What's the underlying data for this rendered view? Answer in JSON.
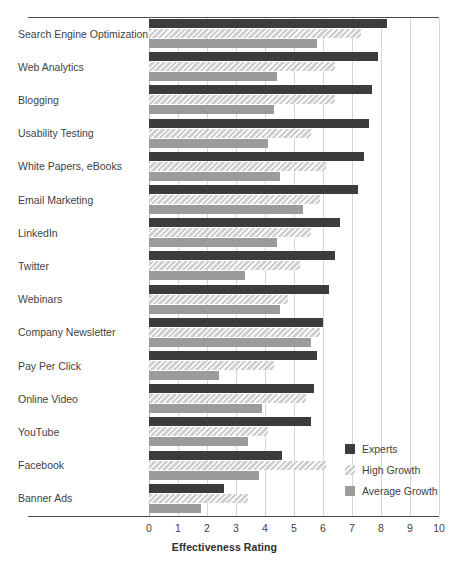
{
  "chart_data": {
    "type": "bar",
    "orientation": "horizontal",
    "title": "",
    "xlabel": "Effectiveness Rating",
    "ylabel": "",
    "xlim": [
      0,
      10
    ],
    "xticks": [
      "0",
      "1",
      "2",
      "3",
      "4",
      "5",
      "6",
      "7",
      "8",
      "9",
      "10"
    ],
    "grid": "vertical",
    "legend_position": "inside-right",
    "categories": [
      "Search Engine Optimization",
      "Web Analytics",
      "Blogging",
      "Usability Testing",
      "White Papers, eBooks",
      "Email Marketing",
      "LinkedIn",
      "Twitter",
      "Webinars",
      "Company Newsletter",
      "Pay Per Click",
      "Online Video",
      "YouTube",
      "Facebook",
      "Banner Ads"
    ],
    "series": [
      {
        "name": "Experts",
        "color": "#3c3c3c",
        "values": [
          8.2,
          7.9,
          7.7,
          7.6,
          7.4,
          7.2,
          6.6,
          6.4,
          6.2,
          6.0,
          5.8,
          5.7,
          5.6,
          4.6,
          2.6
        ]
      },
      {
        "name": "High Growth",
        "color": "#cfcfcf",
        "values": [
          7.3,
          6.4,
          6.4,
          5.6,
          6.1,
          5.9,
          5.6,
          5.2,
          4.8,
          5.9,
          4.3,
          5.4,
          4.1,
          6.1,
          3.4
        ]
      },
      {
        "name": "Average Growth",
        "color": "#9b9b9b",
        "values": [
          5.8,
          4.4,
          4.3,
          4.1,
          4.5,
          5.3,
          4.4,
          3.3,
          4.5,
          5.6,
          2.4,
          3.9,
          3.4,
          3.8,
          1.8
        ]
      }
    ]
  },
  "legend": {
    "items": [
      {
        "label": "Experts",
        "swatch": "experts"
      },
      {
        "label": "High Growth",
        "swatch": "high"
      },
      {
        "label": "Average Growth",
        "swatch": "avg"
      }
    ]
  }
}
